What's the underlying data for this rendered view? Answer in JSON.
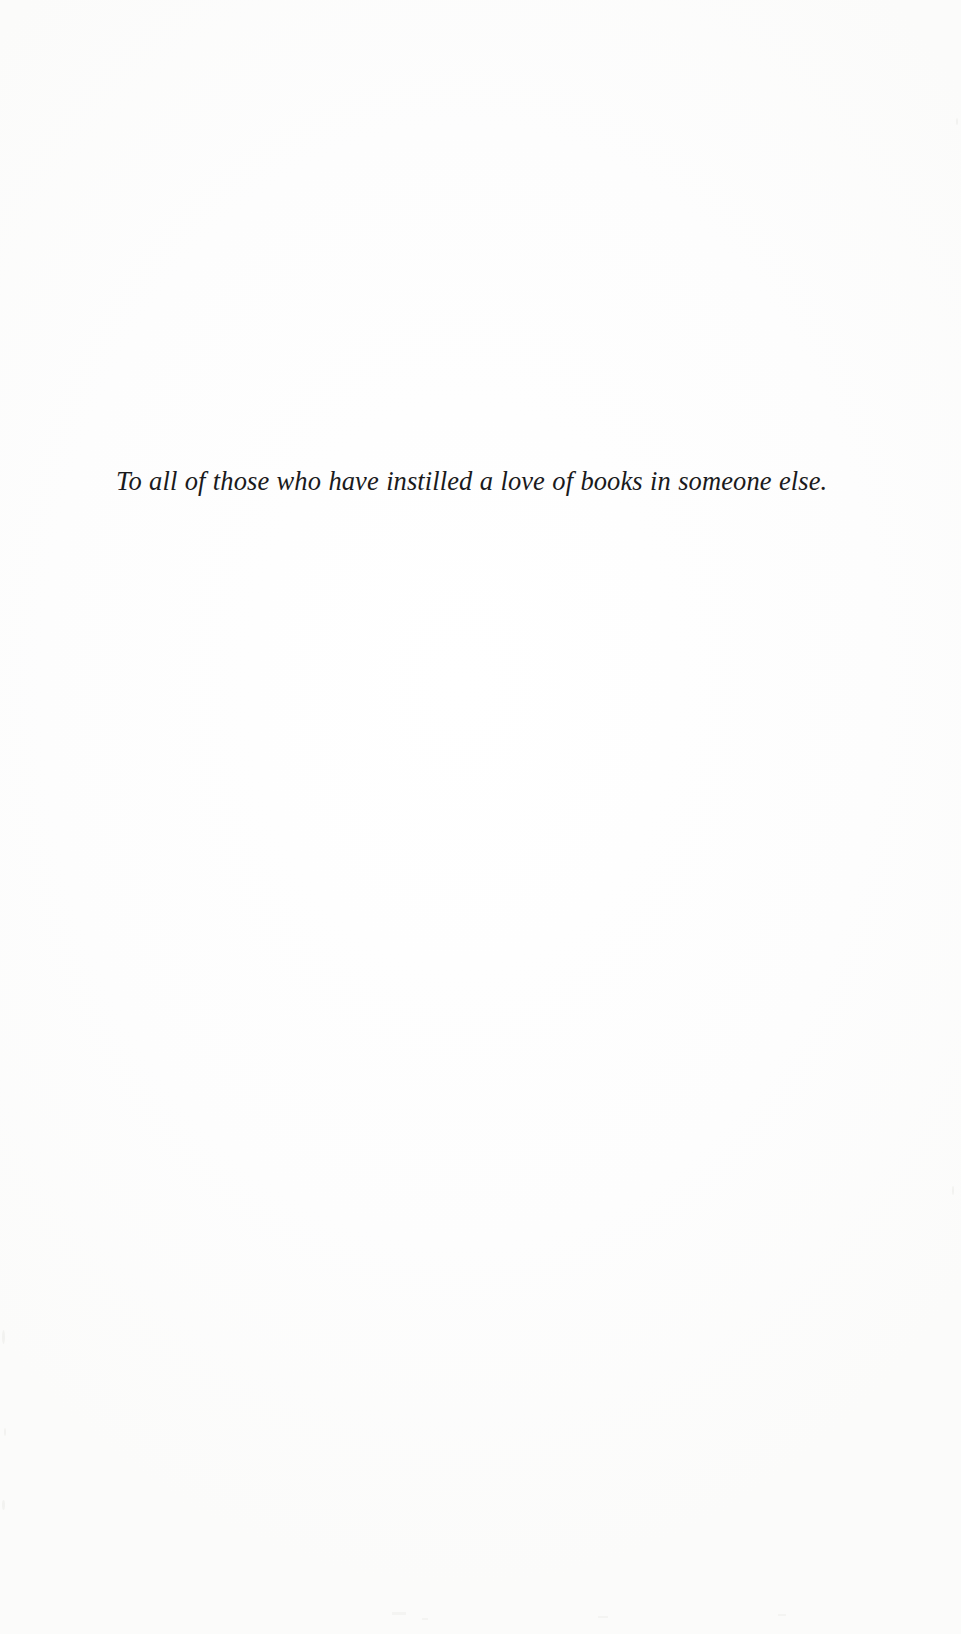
{
  "document": {
    "type": "book-dedication-page",
    "page_background": "#fefefe",
    "text_color": "#1a1a1c",
    "dedication": {
      "text": "To all of those who have instilled a love of books in someone else."
    }
  },
  "artifacts": {
    "specks": [
      {
        "left": 2,
        "top": 1330,
        "w": 3,
        "h": 14
      },
      {
        "left": 2,
        "top": 1500,
        "w": 3,
        "h": 10
      },
      {
        "left": 4,
        "top": 1428,
        "w": 2,
        "h": 8
      },
      {
        "left": 952,
        "top": 1186,
        "w": 2,
        "h": 9
      },
      {
        "left": 956,
        "top": 118,
        "w": 2,
        "h": 7
      },
      {
        "left": 392,
        "top": 1612,
        "w": 14,
        "h": 3
      },
      {
        "left": 598,
        "top": 1616,
        "w": 10,
        "h": 2
      },
      {
        "left": 778,
        "top": 1614,
        "w": 8,
        "h": 2
      },
      {
        "left": 422,
        "top": 1618,
        "w": 6,
        "h": 2
      }
    ]
  }
}
